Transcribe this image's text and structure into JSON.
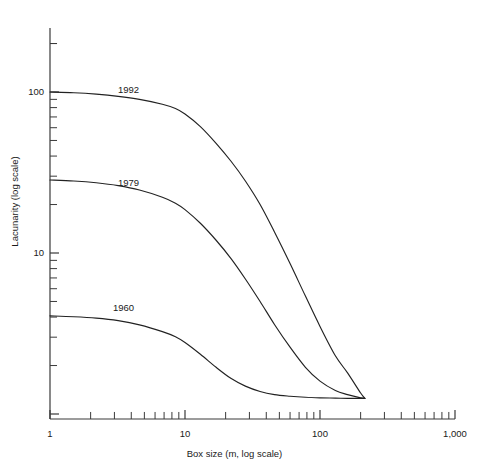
{
  "chart_data": {
    "type": "line",
    "title": "",
    "xlabel": "Box size (m, log scale)",
    "ylabel": "Lacunarity (log scale)",
    "xscale": "log",
    "yscale": "log",
    "xlim": [
      1,
      1000
    ],
    "ylim": [
      1.25,
      400
    ],
    "grid": false,
    "legend_position": "inline-curve-labels",
    "x_tick_labels": [
      "1",
      "10",
      "100",
      "1,000"
    ],
    "x_tick_values": [
      1,
      10,
      100,
      1000
    ],
    "y_tick_labels": [
      "10",
      "100"
    ],
    "y_tick_values": [
      10,
      100
    ],
    "line_color": "#222222",
    "axis_color": "#3a3a3a",
    "series": [
      {
        "name": "1992",
        "label": "1992",
        "x": [
          1,
          1.5,
          2.2,
          3.2,
          4.6,
          6.8,
          8.5,
          10,
          13,
          17,
          22,
          28,
          36,
          46,
          60,
          78,
          100,
          130,
          160,
          200,
          215
        ],
        "values": [
          100,
          99,
          97,
          94,
          90,
          84,
          79,
          73,
          61,
          48,
          37,
          28,
          20,
          13.5,
          8.6,
          5.4,
          3.5,
          2.3,
          1.8,
          1.35,
          1.25
        ]
      },
      {
        "name": "1979",
        "label": "1979",
        "x": [
          1,
          1.5,
          2.2,
          3.2,
          4.6,
          6.8,
          8.5,
          10,
          13,
          17,
          22,
          28,
          36,
          46,
          60,
          78,
          100,
          130,
          160,
          200,
          215
        ],
        "values": [
          28.4,
          28.0,
          27.3,
          26.2,
          24.6,
          22.2,
          20.4,
          18.6,
          15.3,
          12.0,
          9.2,
          6.9,
          5.0,
          3.6,
          2.6,
          1.95,
          1.6,
          1.4,
          1.32,
          1.26,
          1.25
        ]
      },
      {
        "name": "1960",
        "label": "1960",
        "x": [
          1,
          1.5,
          2.2,
          3.2,
          4.6,
          6.8,
          8.5,
          10,
          13,
          17,
          22,
          28,
          36,
          46,
          60,
          78,
          100,
          130,
          160,
          200,
          215
        ],
        "values": [
          4.07,
          4.02,
          3.94,
          3.8,
          3.58,
          3.25,
          3.02,
          2.78,
          2.35,
          1.95,
          1.66,
          1.49,
          1.38,
          1.32,
          1.29,
          1.27,
          1.26,
          1.255,
          1.25,
          1.25,
          1.25
        ]
      }
    ],
    "series_label_positions": [
      {
        "name": "1992",
        "x_px": 118,
        "y_px": 93
      },
      {
        "name": "1979",
        "x_px": 118,
        "y_px": 186
      },
      {
        "name": "1960",
        "x_px": 113,
        "y_px": 311
      }
    ]
  }
}
